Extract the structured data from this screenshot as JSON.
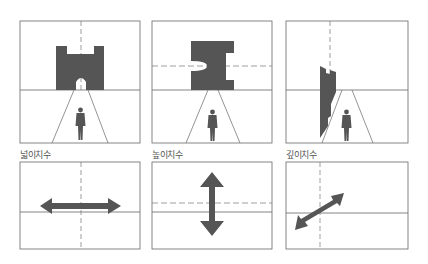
{
  "figure": {
    "colors": {
      "line": "#666666",
      "fill": "#555555",
      "dash": "#777777",
      "background": "#ffffff"
    },
    "panels": [
      {
        "id": "width",
        "label": "넓이치수",
        "guide": "vertical-dashed",
        "arrow": "horizontal"
      },
      {
        "id": "height",
        "label": "높이치수",
        "guide": "horizontal-dashed",
        "arrow": "vertical"
      },
      {
        "id": "depth",
        "label": "깊이치수",
        "guide": "vertical-dashed",
        "arrow": "diagonal"
      }
    ]
  }
}
